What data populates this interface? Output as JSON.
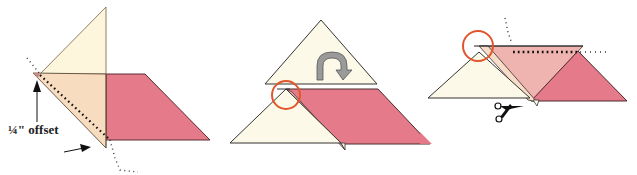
{
  "diagram": {
    "colors": {
      "cream": "#fdf9e6",
      "peach": "#f7dcc0",
      "pink": "#e57a8a",
      "light_pink": "#f0b4b0",
      "stroke": "#3a2a2a",
      "circle": "#e2542a",
      "arrow_gray": "#9a9a9a"
    },
    "panels": [
      {
        "id": "step-1",
        "label": "¼\" offset"
      },
      {
        "id": "step-2",
        "description": "flip triangle"
      },
      {
        "id": "step-3",
        "description": "trim with scissors"
      }
    ]
  }
}
